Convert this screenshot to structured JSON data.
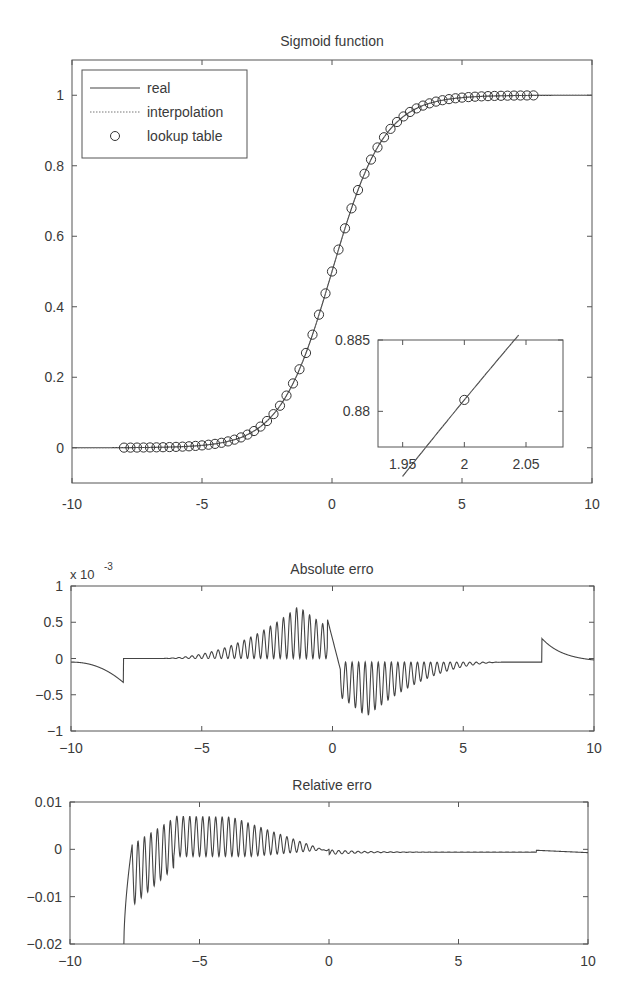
{
  "chart_data": [
    {
      "id": "sigmoid",
      "type": "line",
      "title": "Sigmoid function",
      "xlabel": "",
      "ylabel": "",
      "xlim": [
        -10,
        10
      ],
      "ylim": [
        -0.1,
        1.1
      ],
      "xticks": [
        -10,
        -5,
        0,
        5,
        10
      ],
      "xtick_labels": [
        "-10",
        "-5",
        "0",
        "5",
        "10"
      ],
      "yticks": [
        0,
        0.2,
        0.4,
        0.6,
        0.8,
        1
      ],
      "ytick_labels": [
        "0",
        "0.2",
        "0.4",
        "0.6",
        "0.8",
        "1"
      ],
      "grid": false,
      "legend": {
        "position": "upper-left",
        "entries": [
          {
            "label": "real",
            "style": "solid-line"
          },
          {
            "label": "interpolation",
            "style": "dotted-line"
          },
          {
            "label": "lookup table",
            "style": "circle-marker"
          }
        ]
      },
      "series": [
        {
          "name": "real",
          "function": "1/(1+exp(-x))",
          "x_range": [
            -10,
            10
          ]
        },
        {
          "name": "interpolation",
          "function": "linear interpolation of lookup table",
          "x_range": [
            -10,
            10
          ]
        },
        {
          "name": "lookup table",
          "marker": "circle",
          "x_start": -8,
          "x_end": 7.75,
          "x_step": 0.25
        }
      ],
      "inset": {
        "xlim": [
          1.93,
          2.08
        ],
        "ylim": [
          0.8775,
          0.885
        ],
        "xticks": [
          1.95,
          2,
          2.05
        ],
        "xtick_labels": [
          "1.95",
          "2",
          "2.05"
        ],
        "yticks": [
          0.88,
          0.885
        ],
        "ytick_labels": [
          "0.88",
          "0.885"
        ],
        "marker_point": {
          "x": 2,
          "y": 0.8808
        }
      }
    },
    {
      "id": "absolute-error",
      "type": "line",
      "title": "Absolute erro",
      "title_overlap_glyph": "r",
      "xlabel": "",
      "ylabel": "",
      "scale_label": "x 10",
      "scale_exponent": "-3",
      "xlim": [
        -10,
        10
      ],
      "ylim": [
        -1,
        1
      ],
      "xticks": [
        -10,
        -5,
        0,
        5,
        10
      ],
      "xtick_labels": [
        "−10",
        "−5",
        "0",
        "5",
        "10"
      ],
      "yticks": [
        -1,
        -0.5,
        0,
        0.5,
        1
      ],
      "ytick_labels": [
        "−1",
        "−0.5",
        "0",
        "0.5",
        "1"
      ],
      "grid": false,
      "description": "Error of lookup+interpolation vs real sigmoid (x 1e-3). Outside table range (|x|>8) error follows sigmoid tail; oscillating lobes between table points peaking ~0.7 near x=-1.3 and ~-0.78 near x=1.3.",
      "key_points": [
        {
          "x": -10,
          "y": -0.05
        },
        {
          "x": -8,
          "y": -0.33
        },
        {
          "x": -7.99,
          "y": -0.02
        },
        {
          "x": -5,
          "y": 0.0
        },
        {
          "x": -3,
          "y": 0.25
        },
        {
          "x": -1.3,
          "y": 0.7
        },
        {
          "x": -0.3,
          "y": 0.55
        },
        {
          "x": 0,
          "y": 0.0
        },
        {
          "x": 1.3,
          "y": -0.78
        },
        {
          "x": 3,
          "y": -0.2
        },
        {
          "x": 5,
          "y": -0.05
        },
        {
          "x": 7.99,
          "y": -0.05
        },
        {
          "x": 8,
          "y": 0.28
        },
        {
          "x": 10,
          "y": -0.05
        }
      ]
    },
    {
      "id": "relative-error",
      "type": "line",
      "title": "Relative erro",
      "title_overlap_glyph": "r",
      "xlabel": "",
      "ylabel": "",
      "xlim": [
        -10,
        10
      ],
      "ylim": [
        -0.02,
        0.01
      ],
      "xticks": [
        -10,
        -5,
        0,
        5,
        10
      ],
      "xtick_labels": [
        "−10",
        "−5",
        "0",
        "5",
        "10"
      ],
      "yticks": [
        -0.02,
        -0.01,
        0,
        0.01
      ],
      "ytick_labels": [
        "−0.02",
        "−0.01",
        "0",
        "0.01"
      ],
      "grid": false,
      "description": "Relative error; diverges below -0.02 near x=-8, oscillates with upper envelope ~0.007 between x=-7 and -2, decays to ~-0.0005 after x=0, small step at x=8.",
      "key_points": [
        {
          "x": -7.9,
          "y": -0.02
        },
        {
          "x": -7.6,
          "y": 0.001
        },
        {
          "x": -7.0,
          "y": -0.012
        },
        {
          "x": -6.5,
          "y": 0.002
        },
        {
          "x": -6.0,
          "y": 0.0065
        },
        {
          "x": -4.5,
          "y": 0.007
        },
        {
          "x": -2.5,
          "y": 0.0045
        },
        {
          "x": -1,
          "y": 0.001
        },
        {
          "x": 0,
          "y": -0.0005
        },
        {
          "x": 7.99,
          "y": -0.0006
        },
        {
          "x": 8,
          "y": -0.0002
        },
        {
          "x": 10,
          "y": -0.0007
        }
      ]
    }
  ],
  "layout": {
    "panels": [
      {
        "left": 72,
        "top": 60,
        "right": 592,
        "bottom": 483
      },
      {
        "left": 71,
        "top": 586,
        "right": 594,
        "bottom": 731
      },
      {
        "left": 70,
        "top": 802,
        "right": 588,
        "bottom": 944
      }
    ],
    "inset_box": {
      "left": 378,
      "top": 340,
      "right": 563,
      "bottom": 447
    }
  }
}
